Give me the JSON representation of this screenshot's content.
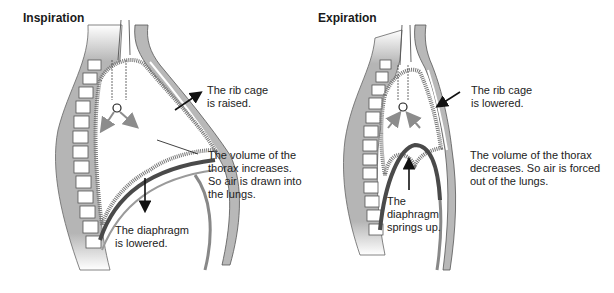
{
  "panels": [
    {
      "title": "Inspiration",
      "labels": {
        "rib_cage": "The rib cage\nis raised.",
        "volume": "The volume of the\nthorax increases.\nSo air is drawn into\nthe lungs.",
        "diaphragm": "The diaphragm\nis lowered."
      }
    },
    {
      "title": "Expiration",
      "labels": {
        "rib_cage": "The rib cage\nis lowered.",
        "volume": "The volume of the thorax\ndecreases. So air is forced\nout of the lungs.",
        "diaphragm": "The\ndiaphragm\nsprings up."
      }
    }
  ],
  "colors": {
    "tissue": "#b8b8b8",
    "tissue_dark": "#8a8a8a",
    "diaphragm": "#4a4a4a",
    "arrow_black": "#111111",
    "arrow_gray": "#8c8c8c"
  }
}
